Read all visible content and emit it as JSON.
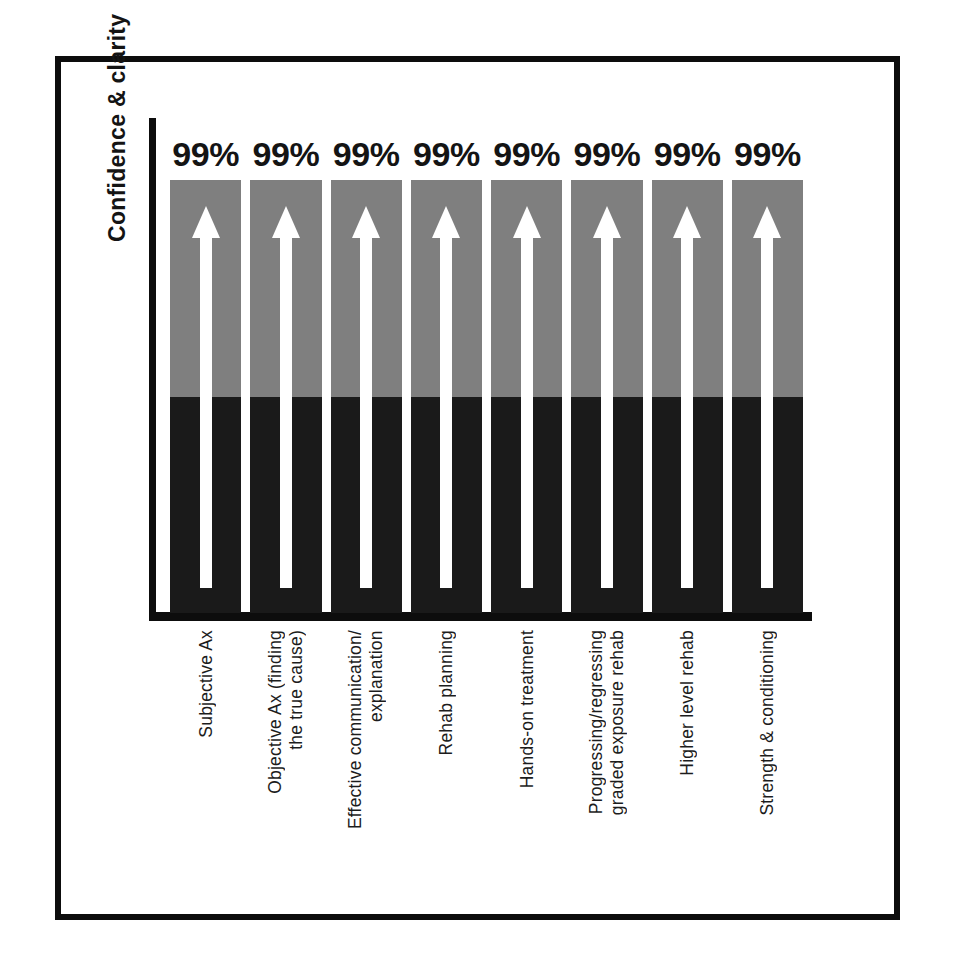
{
  "chart_data": {
    "type": "bar",
    "title": "",
    "ylabel": "Confidence & clarity",
    "xlabel": "",
    "grid": false,
    "legend": "none",
    "ylim": [
      0,
      100
    ],
    "value_suffix": "%",
    "categories": [
      "Subjective Ax",
      "Objective Ax (finding the true cause)",
      "Effective communication/ explanation",
      "Rehab planning",
      "Hands-on treatment",
      "Progressing/regressing graded exposure rehab",
      "Higher level rehab",
      "Strength & conditioning"
    ],
    "category_lines": [
      [
        "Subjective Ax"
      ],
      [
        "Objective Ax (finding",
        "the true cause)"
      ],
      [
        "Effective communication/",
        "explanation"
      ],
      [
        "Rehab planning"
      ],
      [
        "Hands-on treatment"
      ],
      [
        "Progressing/regressing",
        "graded exposure rehab"
      ],
      [
        "Higher level rehab"
      ],
      [
        "Strength & conditioning"
      ]
    ],
    "values": [
      99,
      99,
      99,
      99,
      99,
      99,
      99,
      99
    ],
    "value_labels": [
      "99%",
      "99%",
      "99%",
      "99%",
      "99%",
      "99%",
      "99%",
      "99%"
    ],
    "series": [
      {
        "name": "Confidence & clarity",
        "values": [
          99,
          99,
          99,
          99,
          99,
          99,
          99,
          99
        ]
      }
    ],
    "bar_segments": {
      "upper_fraction": 0.5,
      "lower_fraction": 0.5
    },
    "annotations": [
      {
        "name": "up-arrow",
        "repeat": 8,
        "description": "white upward arrow drawn inside each bar"
      }
    ]
  },
  "colors": {
    "bar_upper": "#7f7f7f",
    "bar_lower": "#1a1a1a",
    "arrow": "#ffffff",
    "axis": "#0d0d0d",
    "frame": "#0d0d0d",
    "background": "#ffffff",
    "text": "#141414"
  }
}
